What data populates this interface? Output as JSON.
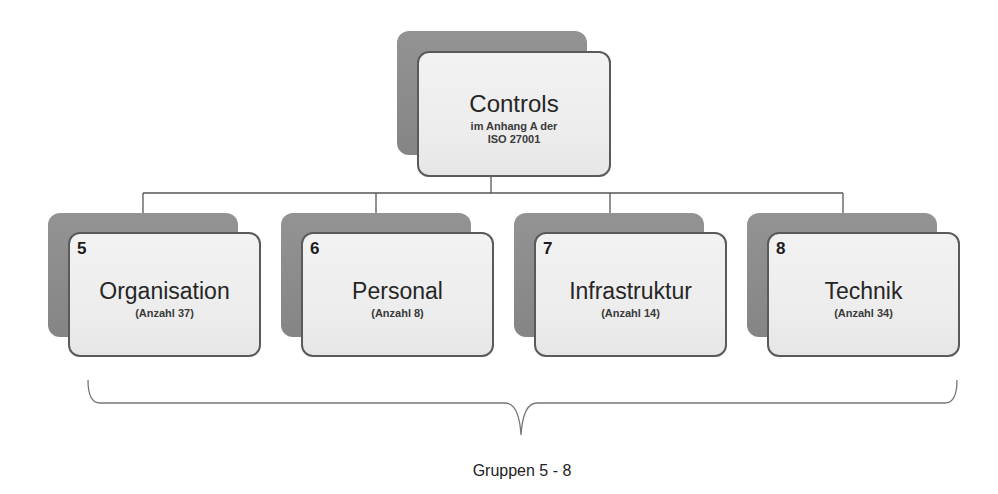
{
  "root": {
    "title": "Controls",
    "subtitle_line1": "im Anhang A der",
    "subtitle_line2": "ISO 27001"
  },
  "groups": [
    {
      "number": "5",
      "title": "Organisation",
      "count_label": "(Anzahl 37)"
    },
    {
      "number": "6",
      "title": "Personal",
      "count_label": "(Anzahl 8)"
    },
    {
      "number": "7",
      "title": "Infrastruktur",
      "count_label": "(Anzahl 14)"
    },
    {
      "number": "8",
      "title": "Technik",
      "count_label": "(Anzahl 34)"
    }
  ],
  "brace_label": "Gruppen 5 - 8",
  "colors": {
    "back_box": "#8c8c8c",
    "front_box": "#efefef",
    "border": "#5a5a5a",
    "line": "#555555"
  }
}
